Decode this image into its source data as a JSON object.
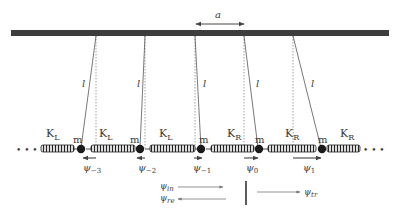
{
  "diagram": {
    "type": "coupled pendulum chain with springs",
    "spacing_label": "a",
    "string_label": "l",
    "mass_label": "m",
    "spring_left_label": "K",
    "spring_left_sub": "L",
    "spring_right_label": "K",
    "spring_right_sub": "R",
    "ellipsis": "• • •",
    "displacements": [
      {
        "symbol": "ψ",
        "sub": "−3",
        "direction": "left"
      },
      {
        "symbol": "ψ",
        "sub": "−2",
        "direction": "left"
      },
      {
        "symbol": "ψ",
        "sub": "−1",
        "direction": "right"
      },
      {
        "symbol": "ψ",
        "sub": "0",
        "direction": "right"
      },
      {
        "symbol": "ψ",
        "sub": "1",
        "direction": "right"
      }
    ],
    "wave_labels": {
      "incident": {
        "symbol": "ψ",
        "sub": "in"
      },
      "reflected": {
        "symbol": "ψ",
        "sub": "re"
      },
      "transmitted": {
        "symbol": "ψ",
        "sub": "tr"
      }
    },
    "colors": {
      "bar": "#3d3d3d",
      "line": "#555555",
      "mass": "#1a1a1a",
      "text": "#3a3a3a"
    }
  }
}
